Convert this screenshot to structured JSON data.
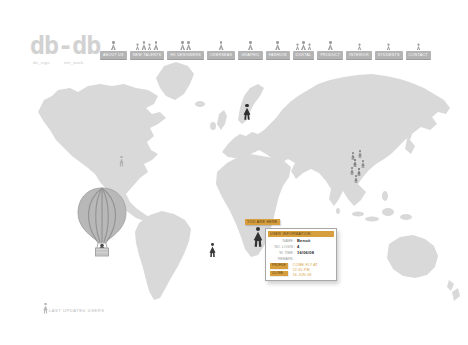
{
  "colors": {
    "accent": "#d79e3e",
    "map_gray": "#d9d9d9",
    "nav_button": "#b4b4b4",
    "figure_dark": "#2f2f2f"
  },
  "logo": {
    "text": "db-db",
    "sub_left": "de_sign",
    "sub_right": "net_work"
  },
  "nav": {
    "items": [
      {
        "label": "ABOUT US"
      },
      {
        "label": "NEW TALENTS"
      },
      {
        "label": "HK DESIGNERS"
      },
      {
        "label": "OVERSEAS"
      },
      {
        "label": "GRAPHIC"
      },
      {
        "label": "FASHION"
      },
      {
        "label": "DIGITAL"
      },
      {
        "label": "PRODUCT"
      },
      {
        "label": "INTERIOR"
      },
      {
        "label": "STUDENTS"
      },
      {
        "label": "CONTACT"
      }
    ]
  },
  "map": {
    "here_label": "YOU ARE HERE",
    "tooltip": {
      "header": "USER INFORMATION",
      "rows": [
        {
          "label": "NAME :",
          "value": "Benoit"
        },
        {
          "label": "NO. LOGIN :",
          "value": "4"
        },
        {
          "label": "W. TIME :",
          "value": "16/06/08"
        },
        {
          "label": "REMARK :",
          "value": ""
        }
      ],
      "remark_lines": [
        "COME FLY AT",
        "12:45 PM",
        "16 JUN 08"
      ],
      "buttons": [
        {
          "label": "PROFILE"
        },
        {
          "label": "CLOSE"
        }
      ]
    }
  },
  "footer": {
    "text": "LAST UPDATED USERS"
  },
  "icons": {
    "person": "person-icon",
    "balloon": "hot-air-balloon-icon"
  }
}
